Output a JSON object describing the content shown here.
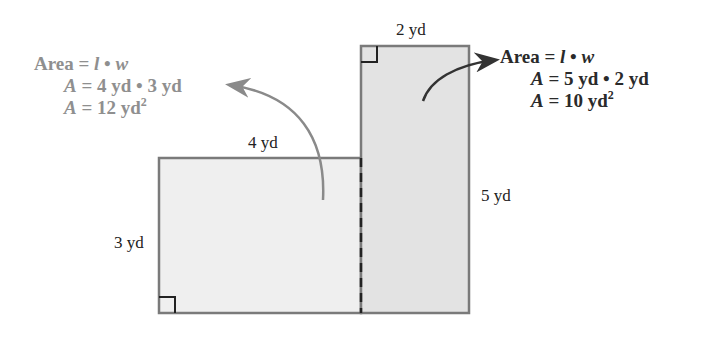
{
  "figure": {
    "left_rect": {
      "width_label": "4 yd",
      "height_label": "3 yd",
      "fill": "#efefef",
      "formula": {
        "line1_word": "Area",
        "line1_rest": " = ",
        "line1_l": "l",
        "line1_dot": " • ",
        "line1_w": "w",
        "line2_var": "A",
        "line2_rest": " = 4 yd • 3 yd",
        "line3_var": "A",
        "line3_rest": " = 12 yd",
        "line3_sup": "2"
      },
      "color": "#8f8f8f"
    },
    "right_rect": {
      "width_label": "2 yd",
      "height_label": "5 yd",
      "fill": "#e3e3e3",
      "formula": {
        "line1_word": "Area",
        "line1_rest": " = ",
        "line1_l": "l",
        "line1_dot": " • ",
        "line1_w": "w",
        "line2_var": "A",
        "line2_rest": " = 5 yd • 2 yd",
        "line3_var": "A",
        "line3_rest": " = 10 yd",
        "line3_sup": "2"
      },
      "color": "#2a2a2a"
    },
    "border_color": "#7a7a7a"
  }
}
